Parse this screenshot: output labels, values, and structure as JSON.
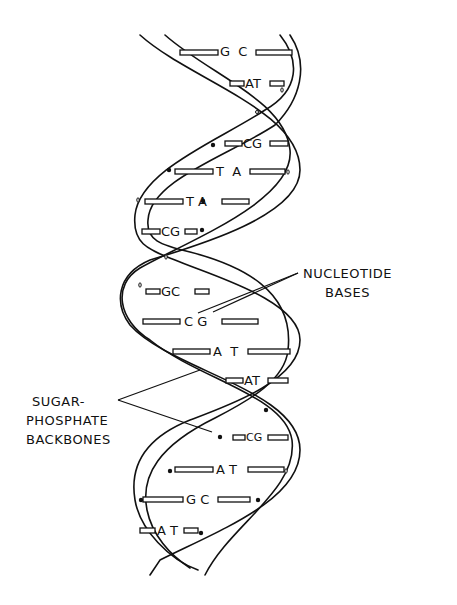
{
  "diagram": {
    "labels": {
      "nucleotide_line1": "NUCLEOTIDE",
      "nucleotide_line2": "BASES",
      "sugar_line1": "SUGAR-",
      "sugar_line2": "PHOSPHATE",
      "sugar_line3": "BACKBONES"
    },
    "base_pairs": [
      {
        "left": "G",
        "right": "C",
        "x": 230,
        "y": 52
      },
      {
        "left": "A",
        "right": "T",
        "x": 256,
        "y": 84
      },
      {
        "left": "C",
        "right": "G",
        "x": 250,
        "y": 144
      },
      {
        "left": "T",
        "right": "A",
        "x": 230,
        "y": 172
      },
      {
        "left": "T",
        "right": "A",
        "x": 205,
        "y": 202
      },
      {
        "left": "C",
        "right": "G",
        "x": 170,
        "y": 232
      },
      {
        "left": "G",
        "right": "C",
        "x": 170,
        "y": 292
      },
      {
        "left": "C",
        "right": "G",
        "x": 200,
        "y": 322
      },
      {
        "left": "A",
        "right": "T",
        "x": 228,
        "y": 352
      },
      {
        "left": "A",
        "right": "T",
        "x": 255,
        "y": 381
      },
      {
        "left": "C",
        "right": "G",
        "x": 255,
        "y": 438
      },
      {
        "left": "A",
        "right": "T",
        "x": 230,
        "y": 470
      },
      {
        "left": "G",
        "right": "C",
        "x": 205,
        "y": 500
      },
      {
        "left": "A",
        "right": "T",
        "x": 165,
        "y": 531
      }
    ]
  }
}
